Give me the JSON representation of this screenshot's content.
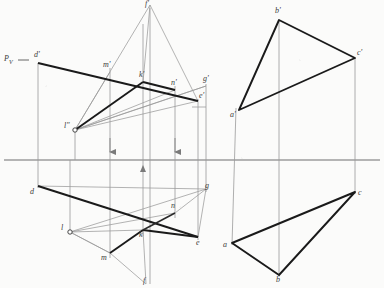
{
  "drawing": {
    "title": "Descriptive geometry: plane intersection and triangle projections",
    "type": "technical-line-drawing",
    "colors": {
      "heavy_line": "#1a1a1a",
      "light_line": "#8a8a8a",
      "medium_line": "#555555",
      "ground_line": "#6e6e6e",
      "label_text": "#3a3a3a",
      "paper": "#fbfbfa"
    },
    "ground_line": {
      "y": 160,
      "x1": 4,
      "x2": 380
    },
    "left_figure": {
      "name": "plane-P-with-piercing-construction",
      "trace_label": {
        "text": "P",
        "subscript": "V"
      },
      "vertices": {
        "d_prime": {
          "x": 38,
          "y": 63,
          "label": "d'"
        },
        "g_prime": {
          "x": 206,
          "y": 86,
          "label": "g'"
        },
        "e_prime": {
          "x": 198,
          "y": 101,
          "label": "e'"
        },
        "d": {
          "x": 38,
          "y": 186,
          "label": "d"
        },
        "e": {
          "x": 198,
          "y": 237,
          "label": "e"
        },
        "g": {
          "x": 206,
          "y": 189,
          "label": "g"
        },
        "f_prime": {
          "x": 150,
          "y": 5,
          "label": "f'"
        },
        "f": {
          "x": 146,
          "y": 284,
          "label": "f"
        },
        "l_double_prime": {
          "x": 75,
          "y": 130,
          "label": "l\""
        },
        "l": {
          "x": 70,
          "y": 232,
          "label": "l"
        },
        "m_prime": {
          "x": 110,
          "y": 72,
          "label": "m'"
        },
        "m": {
          "x": 110,
          "y": 253,
          "label": "m"
        },
        "k_prime": {
          "x": 143,
          "y": 82,
          "label": "k'"
        },
        "k": {
          "x": 143,
          "y": 230,
          "label": "k"
        },
        "n_prime": {
          "x": 175,
          "y": 90,
          "label": "n'"
        },
        "n": {
          "x": 175,
          "y": 213,
          "label": "n"
        }
      },
      "arrows": [
        {
          "x": 110,
          "y": 147,
          "direction": "down"
        },
        {
          "x": 175,
          "y": 147,
          "direction": "down"
        },
        {
          "x": 143,
          "y": 172,
          "direction": "up"
        }
      ]
    },
    "right_figure": {
      "name": "triangle-abc-two-view-projection",
      "vertices": {
        "a_prime": {
          "x": 239,
          "y": 110,
          "label": "a'"
        },
        "b_prime": {
          "x": 279,
          "y": 20,
          "label": "b'"
        },
        "c_prime": {
          "x": 355,
          "y": 58,
          "label": "c'"
        },
        "a": {
          "x": 232,
          "y": 243,
          "label": "a"
        },
        "b": {
          "x": 279,
          "y": 275,
          "label": "b"
        },
        "c": {
          "x": 355,
          "y": 192,
          "label": "c"
        }
      }
    }
  }
}
